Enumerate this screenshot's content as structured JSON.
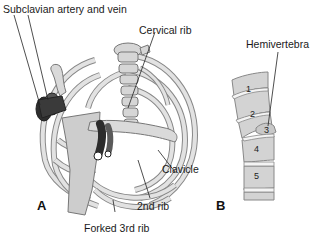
{
  "figure": {
    "panels": [
      {
        "id": "A",
        "label": "A",
        "labels": {
          "subclavian": "Subclavian artery and vein",
          "cervical_rib": "Cervical rib",
          "clavicle": "Clavicle",
          "second_rib": "2nd rib",
          "forked_third_rib": "Forked 3rd rib"
        }
      },
      {
        "id": "B",
        "label": "B",
        "labels": {
          "hemivertebra": "Hemivertebra"
        },
        "vertebrae": [
          "1",
          "2",
          "3",
          "4",
          "5"
        ]
      }
    ],
    "colors": {
      "bone": "#d9d9d9",
      "bone_outline": "#7a7a7a",
      "vessel": "#3a3a3a",
      "sternum": "#cfcfcf",
      "leader_line": "#222222"
    }
  }
}
